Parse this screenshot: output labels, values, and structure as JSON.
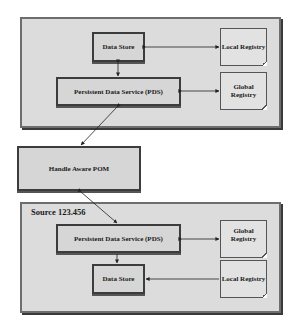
{
  "diagram": {
    "top_group": {
      "data_store": "Data Store",
      "pds": "Persistent Data Service (PDS)",
      "local_registry": "Local Registry",
      "global_registry": "Global Registry"
    },
    "middle": {
      "pom": "Handle Aware POM"
    },
    "bottom_group": {
      "label": "Source 123.456",
      "pds": "Persistent Data Service (PDS)",
      "data_store": "Data Store",
      "global_registry": "Global Registry",
      "local_registry": "Local Registry"
    },
    "colors": {
      "group_fill": "#dcdcdc",
      "box_fill": "#d6d6d6",
      "border": "#3c3c3c",
      "arrow": "#222222"
    },
    "connections": [
      {
        "from": "top.data_store",
        "to": "top.local_registry",
        "type": "bidirectional"
      },
      {
        "from": "top.data_store",
        "to": "top.pds",
        "type": "bidirectional"
      },
      {
        "from": "top.pds",
        "to": "top.global_registry",
        "type": "bidirectional"
      },
      {
        "from": "top.pds",
        "to": "pom",
        "type": "bidirectional"
      },
      {
        "from": "pom",
        "to": "bottom.pds",
        "type": "bidirectional"
      },
      {
        "from": "bottom.pds",
        "to": "bottom.global_registry",
        "type": "bidirectional"
      },
      {
        "from": "bottom.pds",
        "to": "bottom.data_store",
        "type": "directed"
      },
      {
        "from": "bottom.local_registry",
        "to": "bottom.data_store",
        "type": "directed"
      }
    ]
  }
}
